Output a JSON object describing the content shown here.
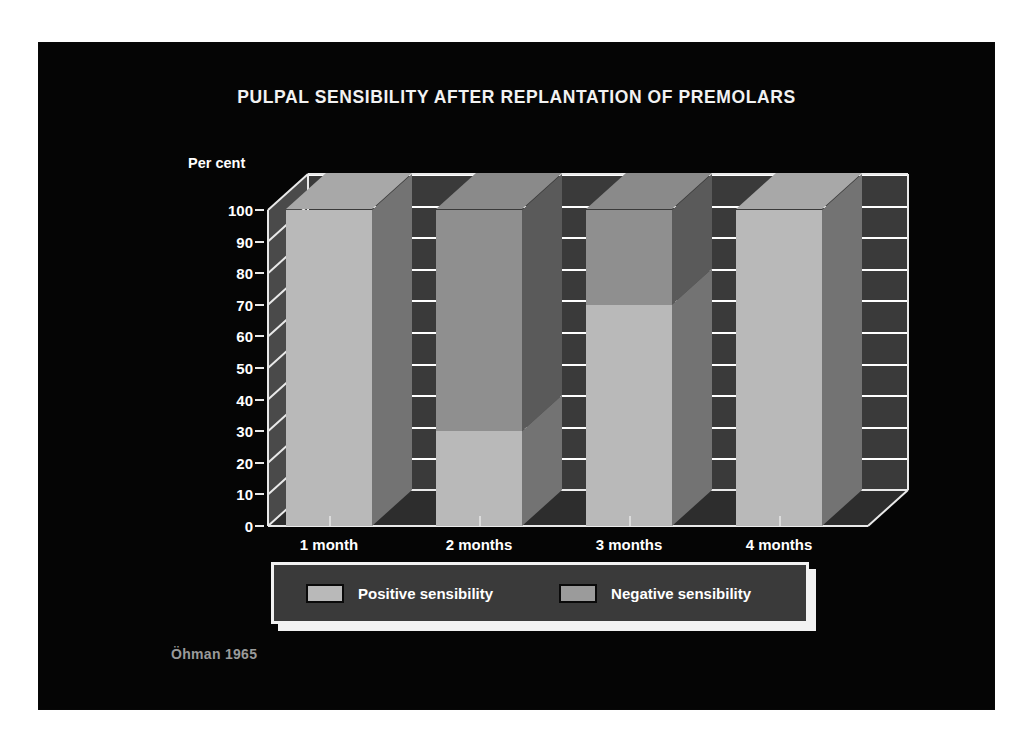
{
  "slide": {
    "background_color": "#050505",
    "page_background": "#ffffff"
  },
  "chart_title": "PULPAL SENSIBILITY AFTER REPLANTATION OF PREMOLARS",
  "attribution": "Öhman 1965",
  "axis": {
    "y_title": "Per cent",
    "y_ticks": [
      "100",
      "90",
      "80",
      "70",
      "60",
      "50",
      "40",
      "30",
      "20",
      "10",
      "0"
    ],
    "x_labels": [
      "1 month",
      "2 months",
      "3 months",
      "4 months"
    ]
  },
  "legend": {
    "items": [
      {
        "label": "Positive sensibility",
        "color": "#b9b9b9"
      },
      {
        "label": "Negative sensibility",
        "color": "#9b9b9b"
      }
    ]
  },
  "chart_data": {
    "type": "bar",
    "stacked": true,
    "title": "PULPAL SENSIBILITY AFTER REPLANTATION OF PREMOLARS",
    "xlabel": "",
    "ylabel": "Per cent",
    "ylim": [
      0,
      100
    ],
    "ytick_step": 10,
    "grid": true,
    "grid_orientation": "horizontal",
    "legend_position": "bottom",
    "three_d": true,
    "categories": [
      "1 month",
      "2 months",
      "3 months",
      "4 months"
    ],
    "series": [
      {
        "name": "Positive sensibility",
        "color": "#b9b9b9",
        "values": [
          100,
          30,
          70,
          100
        ]
      },
      {
        "name": "Negative sensibility",
        "color": "#9b9b9b",
        "values": [
          0,
          70,
          30,
          0
        ]
      }
    ],
    "units": "per cent",
    "annotations": [
      "Öhman 1965"
    ]
  }
}
